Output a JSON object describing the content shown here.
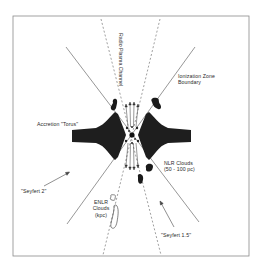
{
  "diagram": {
    "colors": {
      "background": "#ffffff",
      "frame": "#8a8a8a",
      "ionization_line": "#6a6a6a",
      "plasma_dash": "#777777",
      "torus_fill": "#1e1e1e",
      "cloud_fill": "#1a1a1a",
      "text": "#2a2a2a"
    },
    "labels": {
      "radio_plasma_channel": "Radio Plasma Channel",
      "ionization_zone_line1": "Ionization Zone",
      "ionization_zone_line2": "Boundary",
      "accretion_torus": "Accretion \"Torus\"",
      "nlr_clouds_line1": "NLR Clouds",
      "nlr_clouds_line2": "(50 - 100 pc)",
      "seyfert2": "\"Seyfert 2\"",
      "enlr_line1": "ENLR",
      "enlr_line2": "Clouds",
      "enlr_line3": "(kpc)",
      "seyfert15": "\"Seyfert 1.5\""
    }
  }
}
